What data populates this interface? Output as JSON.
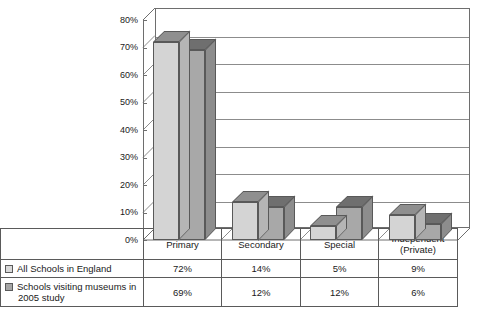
{
  "chart_data": {
    "type": "bar",
    "title": "",
    "subtitle": "",
    "xlabel": "",
    "ylabel": "",
    "categories": [
      "Primary",
      "Secondary",
      "Special",
      "Independent (Private)"
    ],
    "category_lines": [
      [
        "Primary"
      ],
      [
        "Secondary"
      ],
      [
        "Special"
      ],
      [
        "Independent",
        "(Private)"
      ]
    ],
    "series": [
      {
        "name": "All Schools in England",
        "values": [
          72,
          14,
          5,
          9
        ],
        "value_labels": [
          "72%",
          "14%",
          "5%",
          "9%"
        ],
        "color": "#d4d4d4"
      },
      {
        "name": "Schools visiting museums in 2005 study",
        "name_lines": [
          "Schools visiting museums in",
          "2005 study"
        ],
        "values": [
          69,
          12,
          12,
          6
        ],
        "value_labels": [
          "69%",
          "12%",
          "12%",
          "6%"
        ],
        "color": "#a8a8a8"
      }
    ],
    "ylim": [
      0,
      80
    ],
    "ytick_values": [
      0,
      10,
      20,
      30,
      40,
      50,
      60,
      70,
      80
    ],
    "ytick_labels": [
      "0%",
      "10%",
      "20%",
      "30%",
      "40%",
      "50%",
      "60%",
      "70%",
      "80%"
    ],
    "grid": true,
    "grid_axis": "y",
    "legend_position": "table-row-headers",
    "projection": "3d-column"
  },
  "axis": {
    "ticks": [
      {
        "label": "80%"
      },
      {
        "label": "70%"
      },
      {
        "label": "60%"
      },
      {
        "label": "50%"
      },
      {
        "label": "40%"
      },
      {
        "label": "30%"
      },
      {
        "label": "20%"
      },
      {
        "label": "10%"
      },
      {
        "label": "0%"
      }
    ]
  },
  "table": {
    "category_headers": [
      "Primary",
      "Secondary",
      "Special",
      "Independent"
    ],
    "category_header_sub": [
      "",
      "",
      "",
      "(Private)"
    ],
    "rows": [
      {
        "legend": "All Schools in England",
        "legend_line2": "",
        "swatch_color": "#d9d9d9",
        "values": [
          "72%",
          "14%",
          "5%",
          "9%"
        ]
      },
      {
        "legend": "Schools visiting museums in",
        "legend_line2": "2005 study",
        "swatch_color": "#a6a6a6",
        "values": [
          "69%",
          "12%",
          "12%",
          "6%"
        ]
      }
    ]
  },
  "colors": {
    "series1_front": "#d4d4d4",
    "series1_top": "#8f8f8f",
    "series1_side": "#b5b5b5",
    "series2_front": "#a8a8a8",
    "series2_top": "#6f6f6f",
    "series2_side": "#8d8d8d",
    "outline": "#595959",
    "grid": "#8c8c8c",
    "axis": "#6e6e6e",
    "text": "#1a1a1a"
  }
}
